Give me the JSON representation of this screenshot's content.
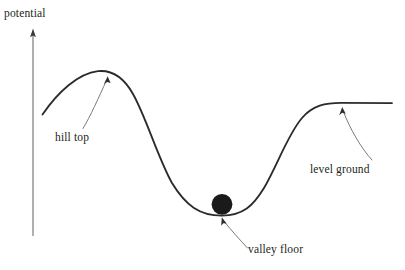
{
  "figure": {
    "type": "potential-energy-landscape-diagram",
    "background_color": "#ffffff",
    "stroke_color": "#231f20",
    "curve_color": "#2b2b2b",
    "leader_color": "#4a4a4a",
    "axis_color": "#58595b",
    "ball_color": "#1a1a1a",
    "width": 405,
    "height": 270
  },
  "axis": {
    "label": "potential",
    "orientation": "vertical",
    "arrow": "up-arrow-icon",
    "x": 33,
    "top_y": 30,
    "bottom_y": 236
  },
  "curve": {
    "name": "potential-energy-curve",
    "description": "hill then valley then level plateau",
    "start": {
      "x": 42,
      "y": 114
    },
    "hill_top": {
      "x": 107,
      "y": 71
    },
    "valley_floor": {
      "x": 222,
      "y": 215
    },
    "plateau_y": 103,
    "end": {
      "x": 392,
      "y": 103
    }
  },
  "ball": {
    "name": "ball",
    "center_x": 222,
    "center_y": 204,
    "radius": 10.5,
    "color": "#1a1a1a"
  },
  "annotations": [
    {
      "id": "hill-top",
      "label": "hill top",
      "label_x": 55,
      "label_y": 131,
      "arrow_tip": {
        "x": 108,
        "y": 77
      },
      "arrow_tail": {
        "x": 83,
        "y": 128
      }
    },
    {
      "id": "valley-floor",
      "label": "valley floor",
      "label_x": 248,
      "label_y": 243,
      "arrow_tip": {
        "x": 222,
        "y": 217
      },
      "arrow_tail": {
        "x": 248,
        "y": 248
      }
    },
    {
      "id": "level-ground",
      "label": "level ground",
      "label_x": 310,
      "label_y": 163,
      "arrow_tip": {
        "x": 342,
        "y": 107
      },
      "arrow_tail": {
        "x": 372,
        "y": 160
      }
    }
  ]
}
